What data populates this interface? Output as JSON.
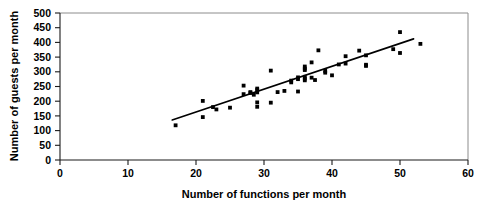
{
  "chart_data": {
    "type": "scatter",
    "title": "",
    "xlabel": "Number of functions per month",
    "ylabel": "Number of guests per month",
    "xlim": [
      0,
      60
    ],
    "ylim": [
      0,
      500
    ],
    "xticks": [
      0,
      10,
      20,
      30,
      40,
      50,
      60
    ],
    "yticks": [
      0,
      50,
      100,
      150,
      200,
      250,
      300,
      350,
      400,
      450,
      500
    ],
    "xtick_labels": [
      "0",
      "10",
      "20",
      "30",
      "40",
      "50",
      "60"
    ],
    "ytick_labels": [
      "0",
      "50",
      "100",
      "150",
      "200",
      "250",
      "300",
      "350",
      "400",
      "450",
      "500"
    ],
    "grid": false,
    "legend": null,
    "marker_color": "#000000",
    "trendline_color": "#000000",
    "series": [
      {
        "name": "Functions vs guests",
        "marker": "square-dot",
        "points": [
          [
            17,
            118
          ],
          [
            21,
            201
          ],
          [
            21,
            146
          ],
          [
            22.5,
            180
          ],
          [
            23,
            172
          ],
          [
            25,
            178
          ],
          [
            27,
            253
          ],
          [
            27,
            224
          ],
          [
            28,
            231
          ],
          [
            28,
            228
          ],
          [
            28.5,
            222
          ],
          [
            29,
            243
          ],
          [
            29,
            238
          ],
          [
            29,
            230
          ],
          [
            29,
            196
          ],
          [
            29,
            181
          ],
          [
            31,
            304
          ],
          [
            31,
            195
          ],
          [
            32,
            231
          ],
          [
            33,
            235
          ],
          [
            34,
            270
          ],
          [
            34,
            264
          ],
          [
            35,
            281
          ],
          [
            35,
            275
          ],
          [
            35,
            233
          ],
          [
            36,
            318
          ],
          [
            36,
            311
          ],
          [
            36,
            306
          ],
          [
            36,
            283
          ],
          [
            36,
            277
          ],
          [
            36,
            271
          ],
          [
            37,
            332
          ],
          [
            37,
            280
          ],
          [
            37.5,
            272
          ],
          [
            38,
            373
          ],
          [
            39,
            303
          ],
          [
            39,
            297
          ],
          [
            40,
            288
          ],
          [
            41,
            325
          ],
          [
            42,
            353
          ],
          [
            42,
            328
          ],
          [
            44,
            372
          ],
          [
            45,
            356
          ],
          [
            45,
            324
          ],
          [
            45,
            320
          ],
          [
            49,
            377
          ],
          [
            50,
            435
          ],
          [
            50,
            364
          ],
          [
            53,
            395
          ]
        ]
      }
    ],
    "trendline": {
      "name": "line of best fit",
      "x_start": 16.5,
      "y_start": 136,
      "x_end": 52.0,
      "y_end": 412
    }
  }
}
